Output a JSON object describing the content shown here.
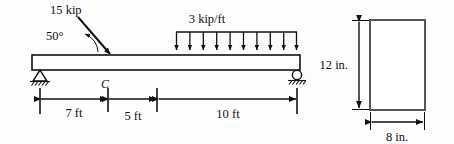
{
  "figure": {
    "background_color": "#fdfdfd",
    "line_color": "#111111",
    "section_outline_color": "#555555"
  },
  "beam": {
    "left_support_type": "pin",
    "right_support_type": "roller",
    "point_label": "C",
    "point_load": {
      "magnitude_label": "15 kip",
      "angle_label": "50°",
      "direction": "down-right"
    },
    "distributed_load": {
      "magnitude_label": "3 kip/ft",
      "arrow_count": 10,
      "direction": "down"
    },
    "dimensions": [
      {
        "label": "7 ft"
      },
      {
        "label": "5 ft"
      },
      {
        "label": "10 ft"
      }
    ]
  },
  "cross_section": {
    "height_label": "12 in.",
    "width_label": "8 in."
  }
}
